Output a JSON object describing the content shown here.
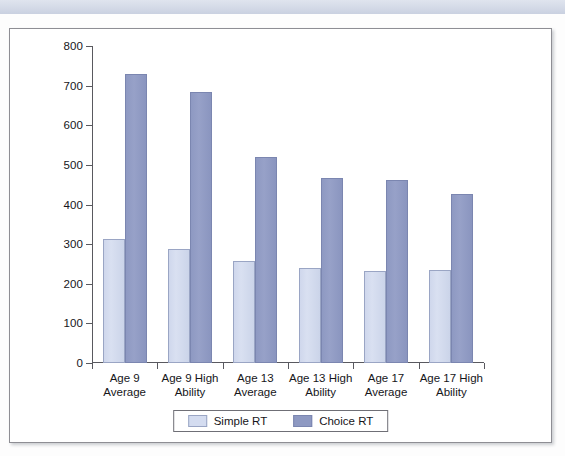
{
  "chart_data": {
    "type": "bar",
    "title": "",
    "xlabel": "",
    "ylabel": "",
    "ylim": [
      0,
      800
    ],
    "yticks": [
      0,
      100,
      200,
      300,
      400,
      500,
      600,
      700,
      800
    ],
    "ytick_labels": [
      "0",
      "100",
      "200",
      "300",
      "400",
      "500",
      "600",
      "700",
      "800"
    ],
    "grid": false,
    "legend_position": "bottom-center",
    "categories": [
      "Age 9\nAverage",
      "Age 9 High\nAbility",
      "Age 13\nAverage",
      "Age 13 High\nAbility",
      "Age 17\nAverage",
      "Age 17 High\nAbility"
    ],
    "category_lines": [
      [
        "Age 9",
        "Average"
      ],
      [
        "Age 9 High",
        "Ability"
      ],
      [
        "Age 13",
        "Average"
      ],
      [
        "Age 13 High",
        "Ability"
      ],
      [
        "Age 17",
        "Average"
      ],
      [
        "Age 17 High",
        "Ability"
      ]
    ],
    "series": [
      {
        "name": "Simple RT",
        "color": "#d4dcf0",
        "values": [
          312,
          287,
          258,
          240,
          231,
          234
        ]
      },
      {
        "name": "Choice RT",
        "color": "#8e99c2",
        "values": [
          730,
          685,
          520,
          466,
          462,
          427
        ]
      }
    ]
  },
  "legend": {
    "items": [
      {
        "label": "Simple RT"
      },
      {
        "label": "Choice RT"
      }
    ]
  },
  "colors": {
    "simple_rt": "#d4dcf0",
    "choice_rt": "#8e99c2",
    "axis": "#59595f",
    "text": "#16161a",
    "banner": "#d4dae7",
    "frame_border": "#8e8e94"
  }
}
